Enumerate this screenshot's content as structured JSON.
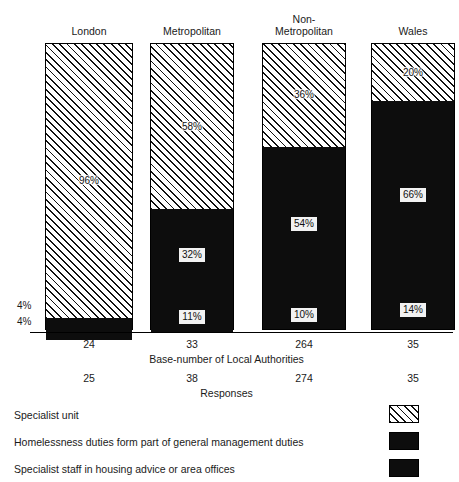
{
  "chart_data": {
    "type": "bar",
    "subtype": "stacked-percentage",
    "title": "",
    "xlabel": "",
    "ylabel": "",
    "ylim": [
      0,
      100
    ],
    "grid": false,
    "legend_position": "bottom",
    "categories": [
      "London",
      "Metropolitan",
      "Non-\nMetropolitan",
      "Wales"
    ],
    "series": [
      {
        "name": "Specialist unit",
        "pattern": "hatch",
        "color": "#ffffff",
        "values": [
          96,
          58,
          36,
          20
        ]
      },
      {
        "name": "Homelessness duties form part of general management duties",
        "pattern": "solid",
        "color": "#0d0d0d",
        "values": [
          4,
          32,
          54,
          66
        ]
      },
      {
        "name": "Specialist staff in housing advice or area offices",
        "pattern": "solid",
        "color": "#0d0d0d",
        "values": [
          4,
          11,
          10,
          14
        ]
      }
    ],
    "base_numbers": [
      "24",
      "33",
      "264",
      "35"
    ],
    "base_caption": "Base-number of Local Authorities",
    "responses": [
      "25",
      "38",
      "274",
      "35"
    ],
    "responses_caption": "Responses",
    "external_labels": [
      {
        "text": "4%",
        "series": 1,
        "category": 0
      },
      {
        "text": "4%",
        "series": 2,
        "category": 0
      }
    ]
  },
  "bars": [
    {
      "title": "London",
      "segments": [
        {
          "label": "96%",
          "pattern": "hatch",
          "value": 96,
          "label_visible": true
        },
        {
          "label": "4%",
          "pattern": "solid",
          "value": 4,
          "label_visible": false
        },
        {
          "label": "4%",
          "pattern": "solid",
          "value": 4,
          "label_visible": false
        }
      ],
      "side_labels": [
        "4%",
        "4%"
      ],
      "base": "24",
      "responses": "25"
    },
    {
      "title": "Metropolitan",
      "segments": [
        {
          "label": "58%",
          "pattern": "hatch",
          "value": 58,
          "label_visible": true
        },
        {
          "label": "32%",
          "pattern": "solid",
          "value": 32,
          "label_visible": true
        },
        {
          "label": "11%",
          "pattern": "solid",
          "value": 11,
          "label_visible": true
        }
      ],
      "side_labels": [],
      "base": "33",
      "responses": "38"
    },
    {
      "title": "Non-\nMetropolitan",
      "segments": [
        {
          "label": "36%",
          "pattern": "hatch",
          "value": 36,
          "label_visible": true
        },
        {
          "label": "54%",
          "pattern": "solid",
          "value": 54,
          "label_visible": true
        },
        {
          "label": "10%",
          "pattern": "solid",
          "value": 10,
          "label_visible": true
        }
      ],
      "side_labels": [],
      "base": "264",
      "responses": "274"
    },
    {
      "title": "Wales",
      "segments": [
        {
          "label": "20%",
          "pattern": "hatch",
          "value": 20,
          "label_visible": true
        },
        {
          "label": "66%",
          "pattern": "solid",
          "value": 66,
          "label_visible": true
        },
        {
          "label": "14%",
          "pattern": "solid",
          "value": 14,
          "label_visible": true
        }
      ],
      "side_labels": [],
      "base": "35",
      "responses": "35"
    }
  ],
  "axis": {
    "base_caption": "Base-number of Local Authorities",
    "responses_caption": "Responses"
  },
  "legend": {
    "items": [
      {
        "label": "Specialist unit",
        "pattern": "hatch"
      },
      {
        "label": "Homelessness duties form part of general management duties",
        "pattern": "solid"
      },
      {
        "label": "Specialist staff in housing advice or area offices",
        "pattern": "solid"
      }
    ]
  }
}
